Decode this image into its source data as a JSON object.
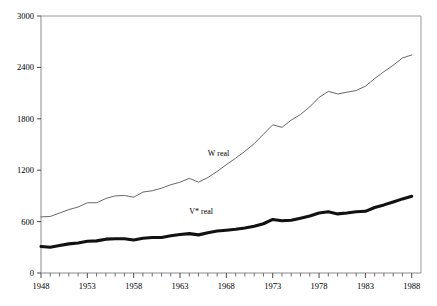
{
  "chart_data": {
    "type": "line",
    "title": "",
    "subtitle": "",
    "xlabel": "",
    "ylabel": "",
    "xlim": [
      1948,
      1989
    ],
    "ylim": [
      0,
      3000
    ],
    "grid": false,
    "legend_position": "inline-annotation",
    "y_ticks": [
      0,
      600,
      1200,
      1800,
      2400,
      3000
    ],
    "y_tick_labels": [
      "0",
      "600",
      "1200",
      "1800",
      "2400",
      "3000"
    ],
    "x_ticks": [
      1948,
      1953,
      1958,
      1963,
      1968,
      1973,
      1978,
      1983,
      1988
    ],
    "x_tick_labels": [
      "1948",
      "1953",
      "1958",
      "1963",
      "1968",
      "1973",
      "1978",
      "1983",
      "1988"
    ],
    "x_minor_tick_interval": 1,
    "x": [
      1948,
      1949,
      1950,
      1951,
      1952,
      1953,
      1954,
      1955,
      1956,
      1957,
      1958,
      1959,
      1960,
      1961,
      1962,
      1963,
      1964,
      1965,
      1966,
      1967,
      1968,
      1969,
      1970,
      1971,
      1972,
      1973,
      1974,
      1975,
      1976,
      1977,
      1978,
      1979,
      1980,
      1981,
      1982,
      1983,
      1984,
      1985,
      1986,
      1987,
      1988
    ],
    "series": [
      {
        "name": "W real",
        "label": "W real",
        "color": "#55565a",
        "style": "thin",
        "label_x": 1966,
        "label_y": 1360,
        "values": [
          655,
          660,
          700,
          740,
          770,
          820,
          820,
          870,
          900,
          905,
          885,
          945,
          960,
          990,
          1030,
          1060,
          1105,
          1060,
          1115,
          1185,
          1265,
          1340,
          1420,
          1510,
          1620,
          1730,
          1700,
          1785,
          1850,
          1940,
          2050,
          2120,
          2090,
          2110,
          2130,
          2180,
          2270,
          2350,
          2425,
          2510,
          2545
        ]
      },
      {
        "name": "V* real",
        "label": "V* real",
        "color": "#111111",
        "style": "thick",
        "label_x": 1964,
        "label_y": 690,
        "values": [
          310,
          300,
          320,
          340,
          350,
          370,
          375,
          395,
          400,
          400,
          385,
          405,
          415,
          415,
          435,
          450,
          460,
          445,
          470,
          490,
          500,
          510,
          525,
          545,
          575,
          625,
          610,
          615,
          640,
          665,
          700,
          715,
          690,
          700,
          715,
          720,
          765,
          795,
          830,
          865,
          895
        ]
      }
    ]
  },
  "plot_geometry": {
    "left": 41,
    "right": 421,
    "top": 16,
    "bottom": 273
  }
}
